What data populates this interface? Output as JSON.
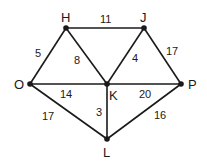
{
  "diagram": {
    "type": "weighted-graph",
    "nodes": [
      {
        "id": "H",
        "label": "H",
        "x": 66,
        "y": 28
      },
      {
        "id": "J",
        "label": "J",
        "x": 144,
        "y": 28
      },
      {
        "id": "O",
        "label": "O",
        "x": 30,
        "y": 84
      },
      {
        "id": "K",
        "label": "K",
        "x": 107,
        "y": 84
      },
      {
        "id": "P",
        "label": "P",
        "x": 181,
        "y": 84
      },
      {
        "id": "L",
        "label": "L",
        "x": 107,
        "y": 139
      }
    ],
    "edges": [
      {
        "from": "H",
        "to": "J",
        "weight": "11"
      },
      {
        "from": "O",
        "to": "H",
        "weight": "5"
      },
      {
        "from": "H",
        "to": "K",
        "weight": "8"
      },
      {
        "from": "J",
        "to": "K",
        "weight": "4"
      },
      {
        "from": "J",
        "to": "P",
        "weight": "17"
      },
      {
        "from": "O",
        "to": "K",
        "weight": "14"
      },
      {
        "from": "K",
        "to": "P",
        "weight": "20"
      },
      {
        "from": "O",
        "to": "L",
        "weight": "17"
      },
      {
        "from": "K",
        "to": "L",
        "weight": "3"
      },
      {
        "from": "L",
        "to": "P",
        "weight": "16"
      }
    ]
  }
}
